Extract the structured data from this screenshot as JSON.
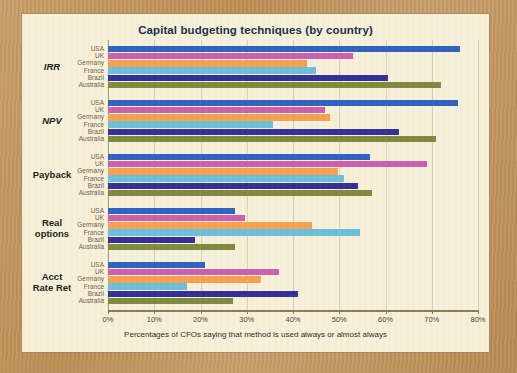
{
  "chart_data": {
    "type": "bar",
    "orientation": "horizontal",
    "title": "Capital budgeting techniques (by country)",
    "xlabel": "Percentages of CFOs saying that method is used always or almost always",
    "ylabel": "",
    "xlim": [
      0,
      80
    ],
    "xticks": [
      0,
      10,
      20,
      30,
      40,
      50,
      60,
      70,
      80
    ],
    "xtick_labels": [
      "0%",
      "10%",
      "20%",
      "30%",
      "40%",
      "50%",
      "60%",
      "70%",
      "80%"
    ],
    "grid": true,
    "legend": "none",
    "categories": [
      "USA",
      "UK",
      "Germany",
      "France",
      "Brazil",
      "Australia"
    ],
    "category_colors": {
      "USA": "#2f62c0",
      "UK": "#cc5fae",
      "Germany": "#f6a153",
      "France": "#6cc0da",
      "Brazil": "#342f96",
      "Australia": "#7f8a3e"
    },
    "groups": [
      {
        "label": "IRR",
        "italic": true,
        "values": [
          76,
          53,
          43,
          45,
          60.5,
          72
        ]
      },
      {
        "label": "NPV",
        "italic": true,
        "values": [
          75.7,
          47,
          48,
          35.7,
          63,
          71
        ]
      },
      {
        "label": "Payback",
        "italic": false,
        "values": [
          56.6,
          69,
          49.7,
          51,
          54,
          57
        ]
      },
      {
        "label": "Real\noptions",
        "italic": false,
        "values": [
          27.4,
          29.6,
          44,
          54.5,
          18.8,
          27.5
        ]
      },
      {
        "label": "Acct\nRate Ret",
        "italic": false,
        "values": [
          21,
          37,
          33,
          17,
          41,
          27
        ]
      }
    ]
  },
  "panel": {
    "background_color": "#f7f0d9",
    "frame_color": "#c49a5e"
  }
}
